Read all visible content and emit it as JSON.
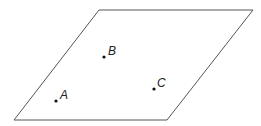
{
  "diagram": {
    "type": "plane-with-points",
    "plane": {
      "shape": "parallelogram",
      "vertices": [
        [
          99,
          10
        ],
        [
          253,
          10
        ],
        [
          167,
          120
        ],
        [
          14,
          120
        ]
      ],
      "stroke": "#555555",
      "stroke_width": 1
    },
    "points": [
      {
        "label": "A",
        "x": 56,
        "y": 101,
        "label_x": 60,
        "label_y": 99
      },
      {
        "label": "B",
        "x": 104,
        "y": 57,
        "label_x": 108,
        "label_y": 55
      },
      {
        "label": "C",
        "x": 154,
        "y": 89,
        "label_x": 157,
        "label_y": 87
      }
    ],
    "point_color": "#111111"
  }
}
